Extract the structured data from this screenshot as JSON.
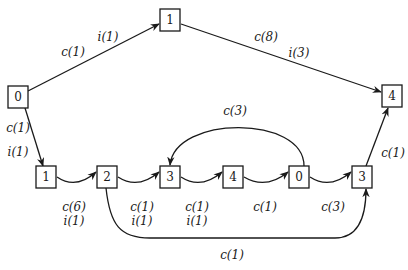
{
  "nodes": [
    {
      "id": "top1",
      "label": "1",
      "x": 170,
      "y": 20
    },
    {
      "id": "left0",
      "label": "0",
      "x": 18,
      "y": 97
    },
    {
      "id": "right4",
      "label": "4",
      "x": 392,
      "y": 96
    },
    {
      "id": "b1",
      "label": "1",
      "x": 46,
      "y": 177
    },
    {
      "id": "b2",
      "label": "2",
      "x": 107,
      "y": 177
    },
    {
      "id": "b3",
      "label": "3",
      "x": 170,
      "y": 177
    },
    {
      "id": "b4",
      "label": "4",
      "x": 233,
      "y": 177
    },
    {
      "id": "b0",
      "label": "0",
      "x": 299,
      "y": 177
    },
    {
      "id": "b3b",
      "label": "3",
      "x": 362,
      "y": 177
    }
  ],
  "edges": [
    {
      "from": "left0",
      "to": "top1",
      "labels": [
        "c(1)",
        "i(1)"
      ]
    },
    {
      "from": "top1",
      "to": "right4",
      "labels": [
        "c(8)",
        "i(3)"
      ]
    },
    {
      "from": "left0",
      "to": "b1",
      "labels": [
        "c(1)",
        "i(1)"
      ]
    },
    {
      "from": "b1",
      "to": "b2",
      "labels": [
        "c(6)",
        "i(1)"
      ]
    },
    {
      "from": "b2",
      "to": "b3",
      "labels": [
        "c(1)",
        "i(1)"
      ]
    },
    {
      "from": "b3",
      "to": "b4",
      "labels": [
        "c(1)",
        "i(1)"
      ]
    },
    {
      "from": "b4",
      "to": "b0",
      "labels": [
        "c(1)"
      ]
    },
    {
      "from": "b0",
      "to": "b3b",
      "labels": [
        "c(3)"
      ]
    },
    {
      "from": "b0",
      "to": "b3",
      "labels": [
        "c(3)"
      ]
    },
    {
      "from": "b2",
      "to": "b3b",
      "labels": [
        "c(1)"
      ]
    },
    {
      "from": "b3b",
      "to": "right4",
      "labels": [
        "c(1)"
      ]
    }
  ],
  "text": {
    "e01_c": "c(1)",
    "e01_i": "i(1)",
    "e14_c": "c(8)",
    "e14_i": "i(3)",
    "e0b1_c": "c(1)",
    "e0b1_i": "i(1)",
    "e12_c": "c(6)",
    "e12_i": "i(1)",
    "e23_c": "c(1)",
    "e23_i": "i(1)",
    "e34_c": "c(1)",
    "e34_i": "i(1)",
    "e40_c": "c(1)",
    "e03_c": "c(3)",
    "eback_c": "c(3)",
    "e2to3b_c": "c(1)",
    "e3b4_c": "c(1)",
    "n_top1": "1",
    "n_left0": "0",
    "n_right4": "4",
    "n_b1": "1",
    "n_b2": "2",
    "n_b3": "3",
    "n_b4": "4",
    "n_b0": "0",
    "n_b3b": "3"
  }
}
